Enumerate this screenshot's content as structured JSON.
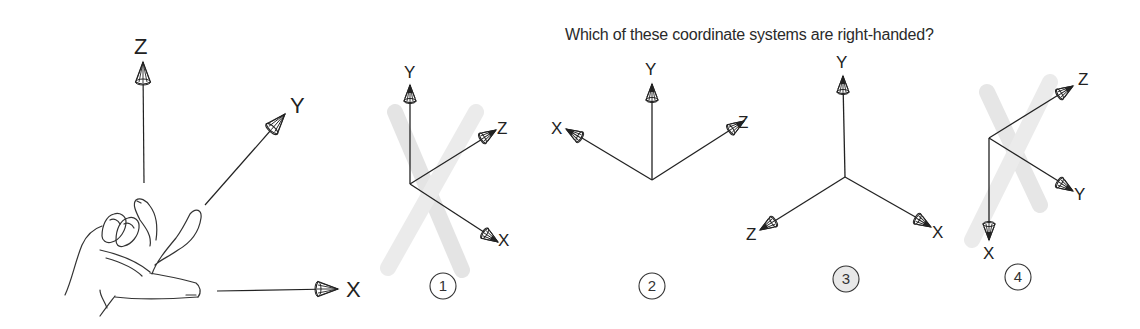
{
  "title": "Which of these coordinate systems are right-handed?",
  "colors": {
    "ink": "#222222",
    "cross_mark": "#d8d8d8",
    "highlight_fill": "#e8e8e8",
    "background": "#ffffff"
  },
  "reference_hand": {
    "description": "Right hand rule illustration",
    "axes": [
      {
        "label": "Z",
        "direction": "up"
      },
      {
        "label": "Y",
        "direction": "up-right (diagonal)"
      },
      {
        "label": "X",
        "direction": "right"
      }
    ]
  },
  "systems": [
    {
      "number": "1",
      "crossed_out": true,
      "highlighted": false,
      "axes": [
        {
          "label": "Y",
          "direction": "up"
        },
        {
          "label": "Z",
          "direction": "up-right"
        },
        {
          "label": "X",
          "direction": "down-right"
        }
      ]
    },
    {
      "number": "2",
      "crossed_out": false,
      "highlighted": false,
      "axes": [
        {
          "label": "Y",
          "direction": "up"
        },
        {
          "label": "X",
          "direction": "up-left"
        },
        {
          "label": "Z",
          "direction": "up-right"
        }
      ]
    },
    {
      "number": "3",
      "crossed_out": false,
      "highlighted": true,
      "axes": [
        {
          "label": "Y",
          "direction": "up"
        },
        {
          "label": "Z",
          "direction": "down-left"
        },
        {
          "label": "X",
          "direction": "down-right"
        }
      ]
    },
    {
      "number": "4",
      "crossed_out": true,
      "highlighted": false,
      "axes": [
        {
          "label": "Z",
          "direction": "up-right"
        },
        {
          "label": "Y",
          "direction": "down-right"
        },
        {
          "label": "X",
          "direction": "down"
        }
      ]
    }
  ]
}
